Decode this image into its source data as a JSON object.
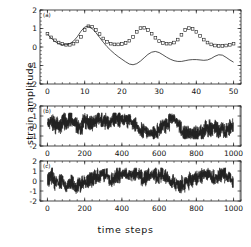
{
  "figure": {
    "xlabel": "time steps",
    "ylabel": "strain amplitude"
  },
  "panels": {
    "a": {
      "label": "(a)"
    },
    "b": {
      "label": "(b)"
    },
    "c": {
      "label": "(c)"
    }
  },
  "axis_text": {
    "y_ticks": [
      "2",
      "1",
      "0",
      "-1",
      "-2"
    ],
    "x_ticks_a": [
      "0",
      "10",
      "20",
      "30",
      "40",
      "50"
    ],
    "x_ticks_bc": [
      "0",
      "200",
      "400",
      "600",
      "800",
      "1000"
    ]
  },
  "colors": {
    "line": "#1a1a1a",
    "marker_stroke": "#1a1a1a",
    "marker_fill": "#ffffff",
    "axis": "#1a1a1a",
    "background": "#ffffff"
  },
  "chart_data": [
    {
      "type": "line",
      "title": "(a)",
      "xlabel": "time steps",
      "ylabel": "strain amplitude",
      "xlim": [
        -2,
        52
      ],
      "ylim": [
        -2,
        2
      ],
      "xticks": [
        0,
        10,
        20,
        30,
        40,
        50
      ],
      "yticks": [
        -2,
        -1,
        0,
        1,
        2
      ],
      "grid": false,
      "legend": "none",
      "series": [
        {
          "name": "observed",
          "style": "open-square-markers",
          "x": [
            0,
            1,
            2,
            3,
            4,
            5,
            6,
            7,
            8,
            9,
            10,
            11,
            12,
            13,
            14,
            15,
            16,
            17,
            18,
            19,
            20,
            21,
            22,
            23,
            24,
            25,
            26,
            27,
            28,
            29,
            30,
            31,
            32,
            33,
            34,
            35,
            36,
            37,
            38,
            39,
            40,
            41,
            42,
            43,
            44,
            45,
            46,
            47,
            48,
            49,
            50
          ],
          "y": [
            0.72,
            0.52,
            0.36,
            0.24,
            0.16,
            0.12,
            0.12,
            0.18,
            0.3,
            0.55,
            0.92,
            1.12,
            1.1,
            0.92,
            0.7,
            0.46,
            0.28,
            0.18,
            0.14,
            0.14,
            0.16,
            0.22,
            0.34,
            0.54,
            0.82,
            1.02,
            1.04,
            0.92,
            0.72,
            0.5,
            0.32,
            0.22,
            0.18,
            0.18,
            0.24,
            0.4,
            0.66,
            0.92,
            1.02,
            0.98,
            0.82,
            0.6,
            0.4,
            0.24,
            0.14,
            0.08,
            0.06,
            0.06,
            0.08,
            0.12,
            0.18
          ]
        },
        {
          "name": "model",
          "style": "solid-line",
          "x": [
            0,
            1,
            2,
            3,
            4,
            5,
            6,
            7,
            8,
            9,
            10,
            11,
            12,
            13,
            14,
            15,
            16,
            17,
            18,
            19,
            20,
            21,
            22,
            23,
            24,
            25,
            26,
            27,
            28,
            29,
            30,
            31,
            32,
            33,
            34,
            35,
            36,
            37,
            38,
            39,
            40,
            41,
            42,
            43,
            44,
            45,
            46,
            47,
            48,
            49,
            50
          ],
          "y": [
            0.7,
            0.48,
            0.3,
            0.18,
            0.12,
            0.12,
            0.18,
            0.32,
            0.55,
            0.85,
            1.08,
            1.12,
            1.0,
            0.78,
            0.52,
            0.26,
            0.02,
            -0.18,
            -0.36,
            -0.52,
            -0.66,
            -0.8,
            -0.92,
            -0.96,
            -0.9,
            -0.76,
            -0.58,
            -0.4,
            -0.28,
            -0.24,
            -0.3,
            -0.42,
            -0.55,
            -0.66,
            -0.74,
            -0.78,
            -0.78,
            -0.74,
            -0.7,
            -0.68,
            -0.68,
            -0.7,
            -0.72,
            -0.7,
            -0.62,
            -0.5,
            -0.42,
            -0.44,
            -0.56,
            -0.7,
            -0.82
          ]
        }
      ]
    },
    {
      "type": "line",
      "title": "(b)",
      "xlabel": "time steps",
      "ylabel": "strain amplitude",
      "xlim": [
        -40,
        1040
      ],
      "ylim": [
        -2,
        2
      ],
      "xticks": [
        0,
        200,
        400,
        600,
        800,
        1000
      ],
      "yticks": [
        -2,
        -1,
        0,
        1,
        2
      ],
      "grid": false,
      "legend": "none",
      "description": "chaotic strain amplitude time series, irregular bursts alternating between roughly +1.2 and -1.2",
      "series": [
        {
          "name": "chaotic-signal-b",
          "style": "solid-line",
          "amplitude_range": [
            -1.3,
            1.3
          ],
          "n_points": 1000
        }
      ]
    },
    {
      "type": "line",
      "title": "(c)",
      "xlabel": "time steps",
      "ylabel": "strain amplitude",
      "xlim": [
        -40,
        1040
      ],
      "ylim": [
        -2,
        2
      ],
      "xticks": [
        0,
        200,
        400,
        600,
        800,
        1000
      ],
      "yticks": [
        -2,
        -1,
        0,
        1,
        2
      ],
      "grid": false,
      "legend": "none",
      "description": "chaotic strain amplitude time series, irregular bursts alternating between roughly +1.2 and -1.2",
      "series": [
        {
          "name": "chaotic-signal-c",
          "style": "solid-line",
          "amplitude_range": [
            -1.3,
            1.3
          ],
          "n_points": 1000
        }
      ]
    }
  ]
}
